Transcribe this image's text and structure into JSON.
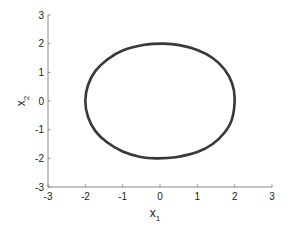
{
  "chart_data": {
    "type": "line",
    "title": "",
    "xlabel": "x1",
    "ylabel": "x2",
    "xlabel_main": "x",
    "xlabel_sub": "1",
    "ylabel_main": "x",
    "ylabel_sub": "2",
    "xlim": [
      -3,
      3
    ],
    "ylim": [
      -3,
      3
    ],
    "xticks": [
      -3,
      -2,
      -1,
      0,
      1,
      2,
      3
    ],
    "yticks": [
      -3,
      -2,
      -1,
      0,
      1,
      2,
      3
    ],
    "xtick_labels": [
      "-3",
      "-2",
      "-1",
      "0",
      "1",
      "2",
      "3"
    ],
    "ytick_labels": [
      "-3",
      "-2",
      "-1",
      "0",
      "1",
      "2",
      "3"
    ],
    "grid": false,
    "legend": null,
    "series": [
      {
        "name": "trajectory",
        "description": "closed orbit (limit cycle), approximately elliptical, x1 in [-2,2], x2 in [-2,2]",
        "color": "#333333",
        "line_width": 2.6,
        "x": [
          2.0,
          1.93,
          1.73,
          1.41,
          1.0,
          0.52,
          0.1,
          -0.42,
          -1.0,
          -1.41,
          -1.73,
          -1.93,
          -2.0,
          -1.93,
          -1.73,
          -1.41,
          -1.0,
          -0.52,
          -0.1,
          0.42,
          1.0,
          1.41,
          1.73,
          1.93,
          2.0
        ],
        "y": [
          0.1,
          0.62,
          1.1,
          1.5,
          1.78,
          1.95,
          2.0,
          1.96,
          1.76,
          1.45,
          1.05,
          0.55,
          0.0,
          -0.55,
          -1.05,
          -1.45,
          -1.76,
          -1.95,
          -2.0,
          -1.96,
          -1.78,
          -1.5,
          -1.1,
          -0.62,
          0.1
        ]
      }
    ]
  },
  "colors": {
    "axis": "#888888",
    "text": "#222222",
    "curve": "#333333",
    "background": "#ffffff"
  }
}
